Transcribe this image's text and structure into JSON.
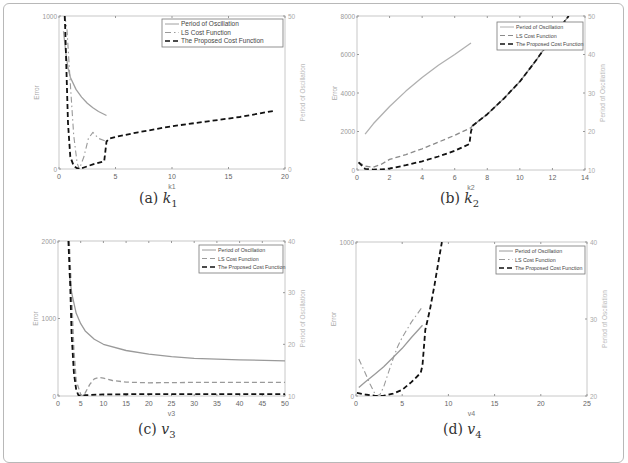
{
  "figure": {
    "subplots": [
      {
        "id": "a",
        "caption_label": "(a)",
        "caption_var": "k",
        "caption_sub": "1"
      },
      {
        "id": "b",
        "caption_label": "(b)",
        "caption_var": "k",
        "caption_sub": "2"
      },
      {
        "id": "c",
        "caption_label": "(c)",
        "caption_var": "v",
        "caption_sub": "3"
      },
      {
        "id": "d",
        "caption_label": "(d)",
        "caption_var": "v",
        "caption_sub": "4"
      }
    ]
  },
  "chart_data": [
    {
      "type": "line",
      "title": "(a) k1",
      "xlabel": "k1",
      "ylabel": "Error",
      "ylabel_right": "Period of Oscillation",
      "xlim": [
        0,
        20
      ],
      "ylim": [
        0,
        1000
      ],
      "ylim_right": [
        0,
        50
      ],
      "xticks": [
        0,
        5,
        10,
        15,
        20
      ],
      "yticks": [
        0,
        1000
      ],
      "yticks_right": [
        0,
        50
      ],
      "legend": [
        "Period of Oscillation",
        "LS Cost Function",
        "The Proposed Cost Function"
      ],
      "legend_position": "upper right",
      "grid": false,
      "series": [
        {
          "name": "Period of Oscillation",
          "axis": "right",
          "style": "solid",
          "color": "#a0a0a0",
          "x": [
            0.4,
            0.6,
            0.8,
            1.0,
            1.5,
            2.0,
            2.5,
            3.0,
            3.5,
            4.2
          ],
          "y": [
            45,
            38,
            33,
            30,
            26,
            23.5,
            21.5,
            20,
            18.8,
            17.5
          ]
        },
        {
          "name": "LS Cost Function",
          "axis": "left",
          "style": "dashdot",
          "color": "#9a9a9a",
          "x": [
            0.5,
            0.7,
            1.0,
            1.3,
            1.6,
            1.8,
            2.2,
            2.6,
            3.0,
            3.5,
            4.2
          ],
          "y": [
            1000,
            920,
            560,
            220,
            40,
            0,
            80,
            200,
            240,
            200,
            180
          ]
        },
        {
          "name": "The Proposed Cost Function",
          "axis": "left",
          "style": "dashed",
          "color": "#111111",
          "x": [
            0.5,
            0.55,
            0.8,
            1.0,
            1.3,
            1.6,
            1.8,
            2.2,
            3.0,
            4.0,
            4.2,
            4.5,
            5.0,
            7.0,
            10.0,
            13.0,
            16.0,
            19.0
          ],
          "y": [
            1000,
            920,
            300,
            80,
            20,
            5,
            0,
            10,
            30,
            50,
            180,
            200,
            210,
            240,
            280,
            310,
            340,
            380
          ]
        }
      ]
    },
    {
      "type": "line",
      "title": "(b) k2",
      "xlabel": "k2",
      "ylabel": "Error",
      "ylabel_right": "Period of Oscillation",
      "xlim": [
        0,
        14
      ],
      "ylim": [
        0,
        8000
      ],
      "ylim_right": [
        10,
        50
      ],
      "xticks": [
        0,
        2,
        4,
        6,
        8,
        10,
        12,
        14
      ],
      "yticks": [
        0,
        2000,
        4000,
        6000,
        8000
      ],
      "yticks_right": [
        10,
        20,
        30,
        40,
        50
      ],
      "legend": [
        "Period of Oscillation",
        "LS Cost Function",
        "The Proposed Cost Function"
      ],
      "legend_position": "upper right",
      "grid": false,
      "series": [
        {
          "name": "Period of Oscillation",
          "axis": "right",
          "style": "solid",
          "color": "#b0b0b0",
          "x": [
            0.5,
            1,
            2,
            3,
            4,
            5,
            6,
            7
          ],
          "y": [
            19.3,
            22,
            26.5,
            30.5,
            34,
            37.2,
            40,
            43
          ]
        },
        {
          "name": "LS Cost Function",
          "axis": "left",
          "style": "dashed",
          "color": "#8a8a8a",
          "x": [
            0.1,
            0.5,
            1.0,
            1.5,
            2.0,
            3.0,
            4.0,
            5.0,
            6.0,
            7.0,
            7.1,
            8,
            9,
            10,
            11,
            12,
            13
          ],
          "y": [
            400,
            200,
            150,
            300,
            550,
            800,
            1100,
            1450,
            1800,
            2200,
            2300,
            2900,
            3700,
            4600,
            5700,
            6900,
            8000
          ]
        },
        {
          "name": "The Proposed Cost Function",
          "axis": "left",
          "style": "dashed",
          "color": "#111111",
          "x": [
            0.1,
            0.5,
            1.0,
            1.5,
            2.0,
            3.0,
            4.0,
            5.0,
            6.0,
            6.9,
            7.0,
            7.1,
            8,
            9,
            10,
            11,
            12,
            13
          ],
          "y": [
            400,
            60,
            20,
            30,
            80,
            250,
            450,
            700,
            1000,
            1350,
            2000,
            2300,
            2900,
            3700,
            4600,
            5700,
            6900,
            8000
          ]
        }
      ]
    },
    {
      "type": "line",
      "title": "(c) v3",
      "xlabel": "v3",
      "ylabel": "Error",
      "ylabel_right": "Period of Oscillation",
      "xlim": [
        0,
        50
      ],
      "ylim": [
        0,
        2000
      ],
      "ylim_right": [
        10,
        40
      ],
      "xticks": [
        0,
        5,
        10,
        15,
        20,
        25,
        30,
        35,
        40,
        45,
        50
      ],
      "yticks": [
        0,
        1000,
        2000
      ],
      "yticks_right": [
        10,
        20,
        30,
        40
      ],
      "legend": [
        "Period of Oscillation",
        "LS Cost Function",
        "The Proposed Cost Function"
      ],
      "legend_position": "upper right",
      "grid": false,
      "series": [
        {
          "name": "Period of Oscillation",
          "axis": "right",
          "style": "solid",
          "color": "#9a9a9a",
          "x": [
            2.5,
            3,
            4,
            5,
            6,
            8,
            10,
            15,
            20,
            25,
            30,
            40,
            50
          ],
          "y": [
            33.8,
            30,
            26,
            24,
            22.6,
            21,
            20,
            18.8,
            18.1,
            17.6,
            17.3,
            17,
            16.8
          ]
        },
        {
          "name": "LS Cost Function",
          "axis": "left",
          "style": "dashed",
          "color": "#9a9a9a",
          "x": [
            2.5,
            3,
            3.5,
            4,
            5,
            5.5,
            6,
            7,
            8,
            9,
            10,
            12,
            15,
            20,
            30,
            40,
            50
          ],
          "y": [
            2000,
            1300,
            600,
            200,
            20,
            0,
            40,
            150,
            220,
            240,
            230,
            200,
            180,
            170,
            175,
            175,
            175
          ]
        },
        {
          "name": "The Proposed Cost Function",
          "axis": "left",
          "style": "dashed",
          "color": "#111111",
          "x": [
            2.3,
            2.7,
            3,
            3.5,
            4,
            4.5,
            5,
            6,
            10,
            20,
            30,
            40,
            50
          ],
          "y": [
            2000,
            1400,
            800,
            300,
            80,
            10,
            0,
            10,
            20,
            25,
            25,
            25,
            25
          ]
        }
      ]
    },
    {
      "type": "line",
      "title": "(d) v4",
      "xlabel": "v4",
      "ylabel": "Error",
      "ylabel_right": "Period of Oscillation",
      "xlim": [
        0,
        25
      ],
      "ylim": [
        0,
        1000
      ],
      "ylim_right": [
        20,
        40
      ],
      "xticks": [
        0,
        5,
        10,
        15,
        20,
        25
      ],
      "yticks": [
        0,
        1000
      ],
      "yticks_right": [
        20,
        30,
        40
      ],
      "legend": [
        "Period of Oscillation",
        "LS Cost Function",
        "The Proposed Cost Function"
      ],
      "legend_position": "upper right",
      "grid": false,
      "series": [
        {
          "name": "Period of Oscillation",
          "axis": "right",
          "style": "solid",
          "color": "#9a9a9a",
          "x": [
            0.3,
            1,
            2,
            3,
            4,
            5,
            6,
            7.2
          ],
          "y": [
            21.1,
            21.8,
            22.8,
            23.8,
            25,
            26.2,
            27.6,
            29.2
          ]
        },
        {
          "name": "LS Cost Function",
          "axis": "left",
          "style": "dashdot",
          "color": "#9a9a9a",
          "x": [
            0.3,
            1,
            1.5,
            2,
            2.2,
            2.6,
            3,
            3.5,
            4,
            4.5,
            5,
            6,
            7.2
          ],
          "y": [
            240,
            150,
            80,
            20,
            0,
            10,
            60,
            150,
            240,
            320,
            380,
            480,
            580
          ]
        },
        {
          "name": "The Proposed Cost Function",
          "axis": "left",
          "style": "dashed",
          "color": "#111111",
          "x": [
            0.1,
            1,
            2,
            2.5,
            3,
            4,
            5,
            6,
            7,
            7.2,
            7.5,
            8,
            8.5,
            9,
            9.3
          ],
          "y": [
            20,
            10,
            2,
            0,
            2,
            15,
            40,
            90,
            150,
            200,
            430,
            560,
            720,
            900,
            1000
          ]
        }
      ]
    }
  ]
}
